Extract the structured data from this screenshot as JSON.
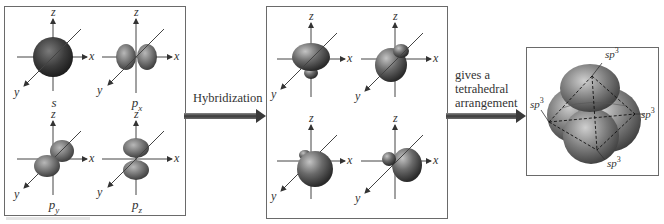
{
  "atomic_orbitals": {
    "items": [
      {
        "name": "s",
        "sub": ""
      },
      {
        "name": "p",
        "sub": "x"
      },
      {
        "name": "p",
        "sub": "y"
      },
      {
        "name": "p",
        "sub": "z"
      }
    ],
    "axis_labels": {
      "x": "x",
      "y": "y",
      "z": "z"
    }
  },
  "arrow1": {
    "label": "Hybridization"
  },
  "hybrid_orbitals": {
    "count": 4,
    "axis_labels": {
      "x": "x",
      "y": "y",
      "z": "z"
    }
  },
  "arrow2": {
    "line1": "gives a",
    "line2": "tetrahedral",
    "line3": "arrangement"
  },
  "tetrahedral": {
    "labels": [
      {
        "base": "sp",
        "sup": "3"
      },
      {
        "base": "sp",
        "sup": "3"
      },
      {
        "base": "sp",
        "sup": "3"
      },
      {
        "base": "sp",
        "sup": "3"
      }
    ]
  },
  "colors": {
    "orbital": "#555555",
    "border": "#6a6a6a",
    "axis": "#444444"
  }
}
